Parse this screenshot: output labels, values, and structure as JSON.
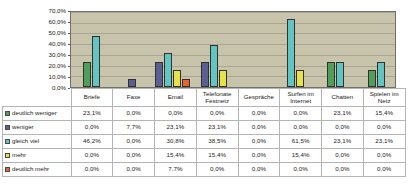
{
  "chart_data": {
    "type": "bar",
    "title": "",
    "xlabel": "",
    "ylabel": "",
    "ylim": [
      0,
      70
    ],
    "ytick_labels": [
      "70,0%",
      "60,0%",
      "50,0%",
      "40,0%",
      "30,0%",
      "20,0%",
      "10,0%",
      "0,0%"
    ],
    "ytick_values": [
      70,
      60,
      50,
      40,
      30,
      20,
      10,
      0
    ],
    "grid": true,
    "legend_position": "table-row-headers",
    "categories": [
      "Briefe",
      "Faxe",
      "Email",
      "Telefonate Festnetz",
      "Gespräche",
      "Surfen im Internet",
      "Chatten",
      "Spielen im Netz"
    ],
    "category_lines": [
      [
        "Briefe"
      ],
      [
        "Faxe"
      ],
      [
        "Email"
      ],
      [
        "Telefonate",
        "Festnetz"
      ],
      [
        "Gespräche"
      ],
      [
        "Surfen im",
        "Internet"
      ],
      [
        "Chatten"
      ],
      [
        "Spielen im",
        "Netz"
      ]
    ],
    "series": [
      {
        "name": "deutlich weniger",
        "color": "#4f9e5b",
        "values": [
          23.1,
          0.0,
          0.0,
          0.0,
          0.0,
          0.0,
          23.1,
          15.4
        ],
        "labels": [
          "23,1%",
          "0,0%",
          "0,0%",
          "0,0%",
          "0,0%",
          "0,0%",
          "23,1%",
          "15,4%"
        ]
      },
      {
        "name": "weniger",
        "color": "#5a5f94",
        "values": [
          0.0,
          7.7,
          23.1,
          23.1,
          0.0,
          0.0,
          0.0,
          0.0
        ],
        "labels": [
          "0,0%",
          "7,7%",
          "23,1%",
          "23,1%",
          "0,0%",
          "0,0%",
          "0,0%",
          "0,0%"
        ]
      },
      {
        "name": "gleich viel",
        "color": "#63c4c4",
        "values": [
          46.2,
          0.0,
          30.8,
          38.5,
          0.0,
          61.5,
          23.1,
          23.1
        ],
        "labels": [
          "46,2%",
          "0,0%",
          "30,8%",
          "38,5%",
          "0,0%",
          "61,5%",
          "23,1%",
          "23,1%"
        ]
      },
      {
        "name": "mehr",
        "color": "#e8e24a",
        "values": [
          0.0,
          0.0,
          15.4,
          15.4,
          0.0,
          15.4,
          0.0,
          0.0
        ],
        "labels": [
          "0,0%",
          "0,0%",
          "15,4%",
          "15,4%",
          "0,0%",
          "15,4%",
          "0,0%",
          "0,0%"
        ]
      },
      {
        "name": "deutlich mehr",
        "color": "#e8642e",
        "values": [
          0.0,
          0.0,
          7.7,
          0.0,
          0.0,
          0.0,
          0.0,
          0.0
        ],
        "labels": [
          "0,0%",
          "0,0%",
          "7,7%",
          "0,0%",
          "0,0%",
          "0,0%",
          "0,0%",
          "0,0%"
        ]
      }
    ]
  },
  "colors": {
    "plot_background": "#c8c3ab",
    "plot_border": "#6f6f6f",
    "gridline": "#a9a693",
    "table_border": "#b4b4b4",
    "page_background": "#ffffff"
  }
}
